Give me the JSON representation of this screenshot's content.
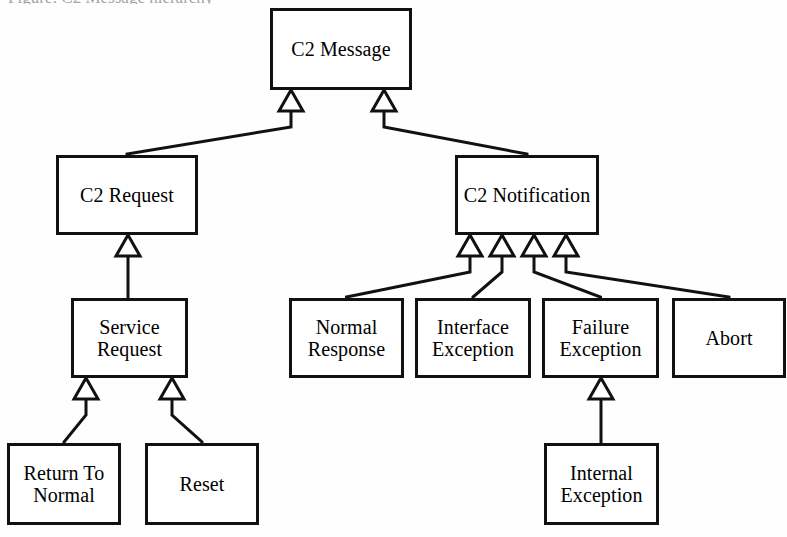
{
  "diagram": {
    "caption_fragment": "Figure: C2 Message hierarchy",
    "type": "uml-class-diagram",
    "relationship": "generalization",
    "arrowhead": "hollow-triangle",
    "colors": {
      "background": "#ffffff",
      "stroke": "#111111",
      "box_fill": "#ffffff",
      "text": "#000000"
    },
    "classes": [
      {
        "id": "c2-message",
        "label": "C2 Message",
        "x": 270,
        "y": 8,
        "w": 142,
        "h": 82
      },
      {
        "id": "c2-request",
        "label": "C2 Request",
        "x": 56,
        "y": 155,
        "w": 142,
        "h": 80
      },
      {
        "id": "c2-notification",
        "label": "C2 Notification",
        "x": 455,
        "y": 155,
        "w": 144,
        "h": 80
      },
      {
        "id": "service-request",
        "label": "Service\nRequest",
        "x": 71,
        "y": 298,
        "w": 117,
        "h": 80
      },
      {
        "id": "normal-response",
        "label": "Normal\nResponse",
        "x": 289,
        "y": 298,
        "w": 115,
        "h": 80
      },
      {
        "id": "interface-exception",
        "label": "Interface\nException",
        "x": 415,
        "y": 298,
        "w": 116,
        "h": 80
      },
      {
        "id": "failure-exception",
        "label": "Failure\nException",
        "x": 542,
        "y": 298,
        "w": 117,
        "h": 80
      },
      {
        "id": "abort",
        "label": "Abort",
        "x": 672,
        "y": 298,
        "w": 114,
        "h": 80
      },
      {
        "id": "return-to-normal",
        "label": "Return To\nNormal",
        "x": 7,
        "y": 443,
        "w": 114,
        "h": 82
      },
      {
        "id": "reset",
        "label": "Reset",
        "x": 145,
        "y": 443,
        "w": 114,
        "h": 82
      },
      {
        "id": "internal-exception",
        "label": "Internal\nException",
        "x": 544,
        "y": 443,
        "w": 115,
        "h": 82
      }
    ],
    "generalizations": [
      {
        "child": "c2-request",
        "parent": "c2-message",
        "arrow_x": 291,
        "arrow_y": 90
      },
      {
        "child": "c2-notification",
        "parent": "c2-message",
        "arrow_x": 384,
        "arrow_y": 90
      },
      {
        "child": "service-request",
        "parent": "c2-request",
        "arrow_x": 128,
        "arrow_y": 235
      },
      {
        "child": "normal-response",
        "parent": "c2-notification",
        "arrow_x": 470,
        "arrow_y": 235
      },
      {
        "child": "interface-exception",
        "parent": "c2-notification",
        "arrow_x": 502,
        "arrow_y": 235
      },
      {
        "child": "failure-exception",
        "parent": "c2-notification",
        "arrow_x": 534,
        "arrow_y": 235
      },
      {
        "child": "abort",
        "parent": "c2-notification",
        "arrow_x": 566,
        "arrow_y": 235
      },
      {
        "child": "return-to-normal",
        "parent": "service-request",
        "arrow_x": 86,
        "arrow_y": 378
      },
      {
        "child": "reset",
        "parent": "service-request",
        "arrow_x": 172,
        "arrow_y": 378
      },
      {
        "child": "internal-exception",
        "parent": "failure-exception",
        "arrow_x": 601,
        "arrow_y": 378
      }
    ]
  }
}
